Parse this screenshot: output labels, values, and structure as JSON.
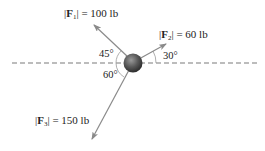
{
  "diagram": {
    "type": "free-body force diagram",
    "reference_line": {
      "style": "dashed",
      "orientation": "horizontal"
    },
    "body": {
      "shape": "sphere",
      "color": "#5a5a5a"
    },
    "forces": [
      {
        "id": "F1",
        "symbol": "F",
        "subscript": "1",
        "magnitude_text": "= 100 lb",
        "magnitude": 100,
        "unit": "lb",
        "angle_label": "45°",
        "angle_deg": 45,
        "direction": "up-left, measured from horizontal (left)"
      },
      {
        "id": "F2",
        "symbol": "F",
        "subscript": "2",
        "magnitude_text": "= 60 lb",
        "magnitude": 60,
        "unit": "lb",
        "angle_label": "30°",
        "angle_deg": 30,
        "direction": "up-right, measured from horizontal (right)"
      },
      {
        "id": "F3",
        "symbol": "F",
        "subscript": "3",
        "magnitude_text": "= 150 lb",
        "magnitude": 150,
        "unit": "lb",
        "angle_label": "60°",
        "angle_deg": 60,
        "direction": "down-left, measured from horizontal (left)"
      }
    ],
    "colors": {
      "arrow": "#8a8a8a",
      "dash": "#7a7a7a",
      "text": "#222222",
      "arc": "#9a9a9a"
    }
  }
}
